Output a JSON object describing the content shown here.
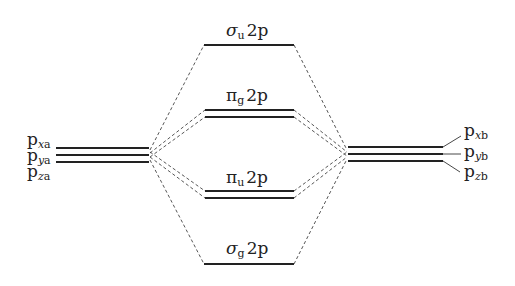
{
  "diagram": {
    "type": "molecular-orbital-energy-diagram",
    "left_atom": {
      "orbitals": [
        {
          "base": "p",
          "axis": "x",
          "atom": "a"
        },
        {
          "base": "p",
          "axis": "y",
          "atom": "a"
        },
        {
          "base": "p",
          "axis": "z",
          "atom": "a"
        }
      ]
    },
    "right_atom": {
      "orbitals": [
        {
          "base": "p",
          "axis": "x",
          "atom": "b"
        },
        {
          "base": "p",
          "axis": "y",
          "atom": "b"
        },
        {
          "base": "p",
          "axis": "z",
          "atom": "b"
        }
      ]
    },
    "molecular_orbitals": [
      {
        "symbol": "σ",
        "sym": "u",
        "label": "2p",
        "degeneracy": 1,
        "character": "antibonding"
      },
      {
        "symbol": "π",
        "sym": "g",
        "label": "2p",
        "degeneracy": 2,
        "character": "antibonding"
      },
      {
        "symbol": "π",
        "sym": "u",
        "label": "2p",
        "degeneracy": 2,
        "character": "bonding"
      },
      {
        "symbol": "σ",
        "sym": "g",
        "label": "2p",
        "degeneracy": 1,
        "character": "bonding"
      }
    ],
    "colors": {
      "level_line": "#222222",
      "dashed_connector": "#444444",
      "text": "#222222",
      "background": "#ffffff"
    }
  }
}
